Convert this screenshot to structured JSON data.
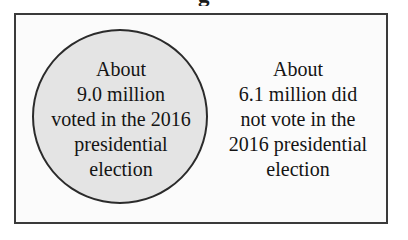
{
  "figure": {
    "clipped_heading_fragment": "g",
    "frame": {
      "border_color": "#3a3a3a",
      "background_color": "#fbfbfb"
    },
    "circle": {
      "name": "voted-set-circle",
      "fill_color": "#e4e4e4",
      "stroke_color": "#2b2b2b"
    },
    "inside_label": {
      "lines": [
        "About",
        "9.0 million",
        "voted in the 2016",
        "presidential",
        "election"
      ],
      "full_text": "About 9.0 million voted in the 2016 presidential election"
    },
    "outside_label": {
      "lines": [
        "About",
        "6.1 million did",
        "not vote in the",
        "2016 presidential",
        "election"
      ],
      "full_text": "About 6.1 million did not vote in the 2016 presidential election"
    }
  },
  "chart_data": {
    "type": "pie",
    "title": "",
    "categories": [
      "Voted in the 2016 presidential election",
      "Did not vote in the 2016 presidential election"
    ],
    "values": [
      9.0,
      6.1
    ],
    "units": "million people",
    "labels": [
      "About 9.0 million voted in the 2016 presidential election",
      "About 6.1 million did not vote in the 2016 presidential election"
    ],
    "legend": "none",
    "grid": false
  }
}
